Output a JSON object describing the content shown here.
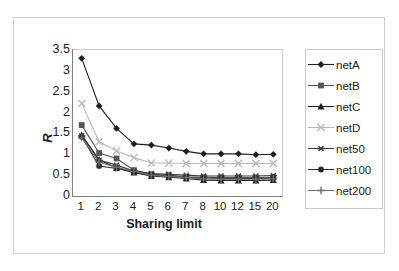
{
  "chart_data": {
    "type": "line",
    "title": "",
    "xlabel": "Sharing limit",
    "ylabel": "R",
    "categories": [
      "1",
      "2",
      "3",
      "4",
      "5",
      "6",
      "7",
      "8",
      "10",
      "12",
      "15",
      "20"
    ],
    "ylim": [
      0,
      3.5
    ],
    "yticks": [
      "0",
      "0.5",
      "1",
      "1.5",
      "2",
      "2.5",
      "3",
      "3.5"
    ],
    "grid": false,
    "legend_position": "right",
    "series": [
      {
        "name": "netA",
        "marker": "diamond",
        "color": "#1f1f1f",
        "values": [
          3.3,
          2.16,
          1.62,
          1.25,
          1.22,
          1.15,
          1.07,
          1.01,
          1.01,
          1.01,
          0.99,
          1.0
        ]
      },
      {
        "name": "netB",
        "marker": "square",
        "color": "#555555",
        "values": [
          1.7,
          1.03,
          0.9,
          0.62,
          0.52,
          0.5,
          0.46,
          0.45,
          0.44,
          0.44,
          0.44,
          0.45
        ]
      },
      {
        "name": "netC",
        "marker": "triangle",
        "color": "#1f1f1f",
        "values": [
          1.46,
          0.87,
          0.67,
          0.56,
          0.48,
          0.45,
          0.42,
          0.38,
          0.37,
          0.37,
          0.37,
          0.38
        ]
      },
      {
        "name": "netD",
        "marker": "cross",
        "color": "#b8b8b8",
        "values": [
          2.22,
          1.3,
          1.08,
          0.92,
          0.79,
          0.79,
          0.78,
          0.78,
          0.78,
          0.78,
          0.78,
          0.78
        ]
      },
      {
        "name": "net50",
        "marker": "asterisk",
        "color": "#3a3a3a",
        "values": [
          1.44,
          0.86,
          0.74,
          0.6,
          0.54,
          0.52,
          0.5,
          0.48,
          0.48,
          0.48,
          0.48,
          0.49
        ]
      },
      {
        "name": "net100",
        "marker": "circle",
        "color": "#2b2b2b",
        "values": [
          1.42,
          0.72,
          0.66,
          0.58,
          0.51,
          0.48,
          0.45,
          0.43,
          0.42,
          0.42,
          0.42,
          0.43
        ]
      },
      {
        "name": "net200",
        "marker": "plus",
        "color": "#6e6e6e",
        "values": [
          1.4,
          0.81,
          0.69,
          0.59,
          0.5,
          0.47,
          0.44,
          0.41,
          0.4,
          0.4,
          0.4,
          0.41
        ]
      }
    ]
  }
}
